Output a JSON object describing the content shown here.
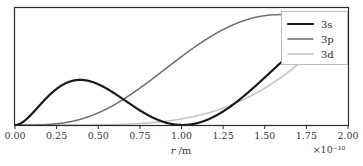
{
  "figure": {
    "background": "#ffffff",
    "frame_color": "#2a2a2a"
  },
  "chart_data": {
    "type": "line",
    "title": "",
    "xlabel": "r /m",
    "ylabel": "",
    "x_exponent_label": "×10⁻¹⁰",
    "xlim": [
      0.0,
      2.0
    ],
    "ylim": [
      0.0,
      1.06
    ],
    "grid": false,
    "x_tick_labels": [
      "0.00",
      "0.25",
      "0.50",
      "0.75",
      "1.00",
      "1.25",
      "1.50",
      "1.75",
      "2.00"
    ],
    "x_ticks": [
      0.0,
      0.25,
      0.5,
      0.75,
      1.0,
      1.25,
      1.5,
      1.75,
      2.0
    ],
    "y_ticks": [],
    "y_tick_labels": [],
    "legend": {
      "position": "upper right",
      "entries": [
        {
          "name": "3s",
          "color": "#1a1a1a",
          "width": 2.2
        },
        {
          "name": "3p",
          "color": "#6e6e6e",
          "width": 1.5
        },
        {
          "name": "3d",
          "color": "#c2c2c2",
          "width": 1.5
        }
      ]
    },
    "series": [
      {
        "name": "3s",
        "color": "#1a1a1a",
        "linewidth": 2.2,
        "orbital": {
          "n": 3,
          "l": 0
        },
        "nodes_at_x": [
          0.107,
          0.434
        ],
        "peaks": [
          {
            "x": 0.045,
            "y": 0.155
          },
          {
            "x": 0.315,
            "y": 0.345
          },
          {
            "x": 1.0,
            "y": 1.0
          }
        ],
        "value_at_xmax": 0.055
      },
      {
        "name": "3p",
        "color": "#6e6e6e",
        "linewidth": 1.5,
        "orbital": {
          "n": 3,
          "l": 1
        },
        "nodes_at_x": [
          0.318
        ],
        "peaks": [
          {
            "x": 0.225,
            "y": 0.395
          },
          {
            "x": 0.92,
            "y": 1.0
          }
        ],
        "value_at_xmax": 0.042
      },
      {
        "name": "3d",
        "color": "#c2c2c2",
        "linewidth": 1.5,
        "orbital": {
          "n": 3,
          "l": 2
        },
        "nodes_at_x": [],
        "peaks": [
          {
            "x": 0.675,
            "y": 1.0
          }
        ],
        "value_at_xmax": 0.022
      }
    ]
  }
}
